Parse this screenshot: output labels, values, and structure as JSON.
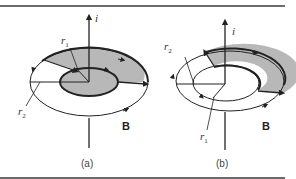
{
  "figure": {
    "panels": [
      {
        "id": "a",
        "caption": "(a)",
        "current_label": "i",
        "field_label": "B",
        "inner_radius_label": "r",
        "inner_radius_sub": "1",
        "outer_radius_label": "r",
        "outer_radius_sub": "2",
        "shaded_region": "inner disk + upper-right annulus sector"
      },
      {
        "id": "b",
        "caption": "(b)",
        "current_label": "i",
        "field_label": "B",
        "inner_radius_label": "r",
        "inner_radius_sub": "1",
        "outer_radius_label": "r",
        "outer_radius_sub": "2",
        "shaded_region": "upper-right annulus sector"
      }
    ],
    "colors": {
      "shade": "#b8b8b8",
      "line": "#222222",
      "rule": "#6b6b6b"
    }
  }
}
